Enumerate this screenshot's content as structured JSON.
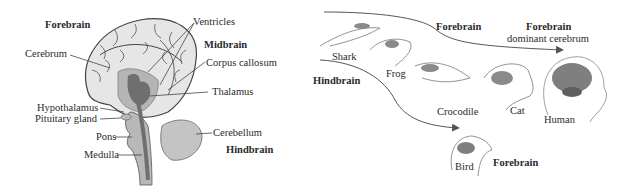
{
  "left_panel": {
    "title": "Human brain sagittal section",
    "labels": {
      "forebrain": "Forebrain",
      "ventricles": "Ventricles",
      "midbrain": "Midbrain",
      "cerebrum": "Cerebrum",
      "corpus_callosum": "Corpus callosum",
      "thalamus": "Thalamus",
      "hypothalamus": "Hypothalamus",
      "pituitary_gland": "Pituitary gland",
      "pons": "Pons",
      "cerebellum": "Cerebellum",
      "hindbrain": "Hindbrain",
      "medulla": "Medulla"
    },
    "colors": {
      "cerebrum_fill": "#e6e6e6",
      "midbrain_fill": "#a9a9a9",
      "thalamus_fill": "#6f6f6f",
      "brainstem_fill": "#b8b8b8",
      "cerebellum_fill": "#c4c4c4",
      "outline": "#444444"
    }
  },
  "right_panel": {
    "title": "Brain evolution across vertebrates",
    "animals": [
      "Shark",
      "Frog",
      "Crocodile",
      "Cat",
      "Human",
      "Bird"
    ],
    "labels": {
      "shark": "Shark",
      "frog": "Frog",
      "crocodile": "Crocodile",
      "cat": "Cat",
      "human": "Human",
      "bird": "Bird",
      "hindbrain": "Hindbrain",
      "forebrain_top": "Forebrain",
      "forebrain_human": "Forebrain",
      "dominant_cerebrum": "dominant cerebrum",
      "forebrain_bird": "Forebrain"
    }
  }
}
